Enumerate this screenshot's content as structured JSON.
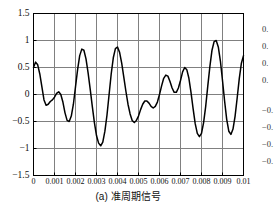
{
  "figure": {
    "caption": "(a) 准周期信号",
    "panel_tag": "(a)"
  },
  "chart_data": {
    "type": "line",
    "title": "",
    "xlabel": "",
    "ylabel": "",
    "xlim": [
      0,
      0.01
    ],
    "ylim": [
      -1.5,
      1.5
    ],
    "grid": true,
    "legend": null,
    "line_color": "#000000",
    "grid_color": "#808080",
    "axis_color": "#000000",
    "background": "#ffffff",
    "xticks": [
      0,
      0.001,
      0.002,
      0.003,
      0.004,
      0.005,
      0.006,
      0.007,
      0.008,
      0.009,
      0.01
    ],
    "xtick_labels": [
      "0",
      "0.001",
      "0.002",
      "0.003",
      "0.004",
      "0.005",
      "0.006",
      "0.007",
      "0.008",
      "0.009",
      "0.01"
    ],
    "yticks": [
      -1.5,
      -1,
      -0.5,
      0,
      0.5,
      1,
      1.5
    ],
    "ytick_labels": [
      "-1.5",
      "-1",
      "-0.5",
      "0",
      "0.5",
      "1",
      "1.5"
    ],
    "series": [
      {
        "name": "quasi-periodic signal",
        "description": "sum of two incommensurate sinusoids",
        "components": [
          {
            "amplitude": 0.55,
            "frequency_hz": 500,
            "phase_rad": 1.0472
          },
          {
            "amplitude": 0.52,
            "frequency_hz": 780,
            "phase_rad": 0.3491
          }
        ],
        "x": [
          0,
          0.0001,
          0.0002,
          0.0003,
          0.0004,
          0.0005,
          0.0006,
          0.0007,
          0.0008,
          0.0009,
          0.001,
          0.0011,
          0.0012,
          0.0013,
          0.0014,
          0.0015,
          0.0016,
          0.0017,
          0.0018,
          0.0019,
          0.002,
          0.0021,
          0.0022,
          0.0023,
          0.0024,
          0.0025,
          0.0026,
          0.0027,
          0.0028,
          0.0029,
          0.003,
          0.0031,
          0.0032,
          0.0033,
          0.0034,
          0.0035,
          0.0036,
          0.0037,
          0.0038,
          0.0039,
          0.004,
          0.0041,
          0.0042,
          0.0043,
          0.0044,
          0.0045,
          0.0046,
          0.0047,
          0.0048,
          0.0049,
          0.005,
          0.0051,
          0.0052,
          0.0053,
          0.0054,
          0.0055,
          0.0056,
          0.0057,
          0.0058,
          0.0059,
          0.006,
          0.0061,
          0.0062,
          0.0063,
          0.0064,
          0.0065,
          0.0066,
          0.0067,
          0.0068,
          0.0069,
          0.007,
          0.0071,
          0.0072,
          0.0073,
          0.0074,
          0.0075,
          0.0076,
          0.0077,
          0.0078,
          0.0079,
          0.008,
          0.0081,
          0.0082,
          0.0083,
          0.0084,
          0.0085,
          0.0086,
          0.0087,
          0.0088,
          0.0089,
          0.009,
          0.0091,
          0.0092,
          0.0093,
          0.0094,
          0.0095,
          0.0096,
          0.0097,
          0.0098,
          0.0099,
          0.01
        ],
        "y": [
          0.5,
          0.6,
          0.55,
          0.38,
          0.14,
          -0.1,
          -0.2,
          -0.18,
          -0.13,
          -0.1,
          -0.05,
          0.02,
          0.05,
          0.0,
          -0.14,
          -0.34,
          -0.48,
          -0.5,
          -0.4,
          -0.18,
          0.14,
          0.46,
          0.72,
          0.84,
          0.82,
          0.66,
          0.4,
          0.1,
          -0.22,
          -0.52,
          -0.76,
          -0.9,
          -0.95,
          -0.88,
          -0.68,
          -0.38,
          0.0,
          0.38,
          0.68,
          0.85,
          0.88,
          0.78,
          0.58,
          0.32,
          0.06,
          -0.18,
          -0.36,
          -0.48,
          -0.52,
          -0.48,
          -0.4,
          -0.28,
          -0.18,
          -0.12,
          -0.12,
          -0.16,
          -0.22,
          -0.25,
          -0.22,
          -0.14,
          0.0,
          0.16,
          0.3,
          0.36,
          0.34,
          0.24,
          0.12,
          0.04,
          0.04,
          0.12,
          0.26,
          0.42,
          0.5,
          0.46,
          0.3,
          0.04,
          -0.26,
          -0.54,
          -0.72,
          -0.78,
          -0.72,
          -0.52,
          -0.22,
          0.16,
          0.52,
          0.82,
          0.98,
          1.0,
          0.88,
          0.62,
          0.26,
          -0.12,
          -0.46,
          -0.68,
          -0.74,
          -0.64,
          -0.4,
          -0.06,
          0.3,
          0.58,
          0.72
        ]
      }
    ]
  },
  "adjacent_panel": {
    "note": "partially visible y tick labels of neighbouring plot",
    "labels": [
      "0.",
      "0.",
      "0.",
      "0.",
      "-0.",
      "-0.",
      "-0.",
      "-0.",
      "-"
    ]
  }
}
